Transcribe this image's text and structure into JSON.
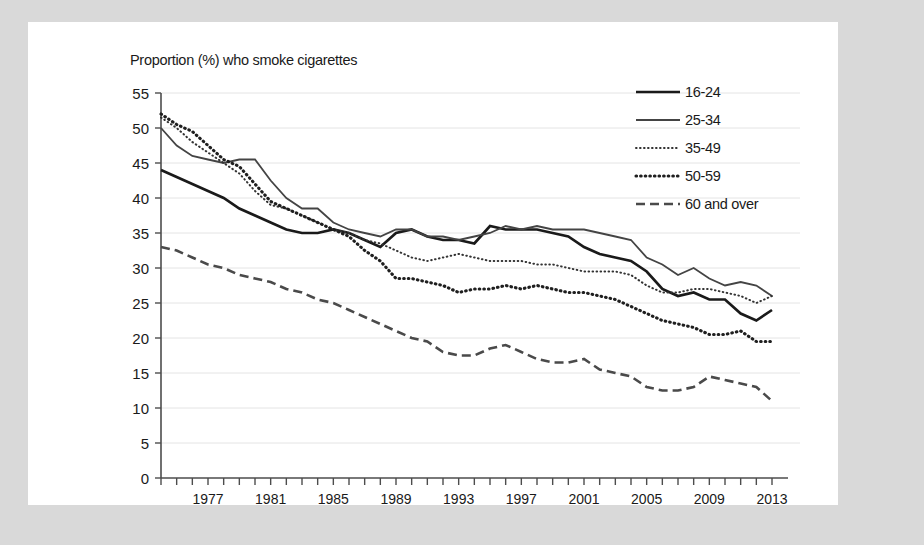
{
  "chart_data": {
    "type": "line",
    "title": "Proportion (%) who smoke cigarettes",
    "xlabel": "",
    "ylabel": "",
    "ylim": [
      0,
      55
    ],
    "xlim": [
      1974,
      2013
    ],
    "ytick_step": 5,
    "grid": true,
    "legend_position": "top-right",
    "yticks": [
      "0",
      "5",
      "10",
      "15",
      "20",
      "25",
      "30",
      "35",
      "40",
      "45",
      "50",
      "55"
    ],
    "xticks_labeled": [
      "1977",
      "1981",
      "1985",
      "1989",
      "1993",
      "1997",
      "2001",
      "2005",
      "2009",
      "2013"
    ],
    "x": [
      1974,
      1975,
      1976,
      1977,
      1978,
      1979,
      1980,
      1981,
      1982,
      1983,
      1984,
      1985,
      1986,
      1987,
      1988,
      1989,
      1990,
      1991,
      1992,
      1993,
      1994,
      1995,
      1996,
      1997,
      1998,
      1999,
      2000,
      2001,
      2002,
      2003,
      2004,
      2005,
      2006,
      2007,
      2008,
      2009,
      2010,
      2011,
      2012,
      2013
    ],
    "series": [
      {
        "name": "16-24",
        "style": "solid-thick",
        "values": [
          44,
          43,
          42,
          41,
          40,
          38.5,
          37.5,
          36.5,
          35.5,
          35,
          35,
          35.5,
          35,
          34,
          33,
          35,
          35.5,
          34.5,
          34,
          34,
          33.5,
          36,
          35.5,
          35.5,
          35.5,
          35,
          34.5,
          33,
          32,
          31.5,
          31,
          29.5,
          27,
          26,
          26.5,
          25.5,
          25.5,
          23.5,
          22.5,
          24
        ]
      },
      {
        "name": "25-34",
        "style": "solid-thin",
        "values": [
          50,
          47.5,
          46,
          45.5,
          45,
          45.5,
          45.5,
          42.5,
          40,
          38.5,
          38.5,
          36.5,
          35.5,
          35,
          34.5,
          35.5,
          35.5,
          34.5,
          34.5,
          34,
          34.5,
          35,
          36,
          35.5,
          36,
          35.5,
          35.5,
          35.5,
          35,
          34.5,
          34,
          31.5,
          30.5,
          29,
          30,
          28.5,
          27.5,
          28,
          27.5,
          26
        ]
      },
      {
        "name": "35-49",
        "style": "dotted-fine",
        "values": [
          51.5,
          50,
          48,
          46.5,
          45,
          43.5,
          41,
          39,
          38.5,
          37.5,
          36.5,
          35.5,
          35,
          34,
          33.5,
          32.5,
          31.5,
          31,
          31.5,
          32,
          31.5,
          31,
          31,
          31,
          30.5,
          30.5,
          30,
          29.5,
          29.5,
          29.5,
          29,
          27.5,
          26.5,
          26.5,
          27,
          27,
          26.5,
          26,
          25,
          26
        ]
      },
      {
        "name": "50-59",
        "style": "dotted-bold",
        "values": [
          52,
          50.5,
          49.5,
          47.5,
          45.5,
          44.5,
          42,
          39.5,
          38.5,
          37.5,
          36.5,
          35.5,
          34.5,
          32.5,
          31,
          28.5,
          28.5,
          28,
          27.5,
          26.5,
          27,
          27,
          27.5,
          27,
          27.5,
          27,
          26.5,
          26.5,
          26,
          25.5,
          24.5,
          23.5,
          22.5,
          22,
          21.5,
          20.5,
          20.5,
          21,
          19.5,
          19.5
        ]
      },
      {
        "name": "60 and over",
        "style": "dashed",
        "values": [
          33,
          32.5,
          31.5,
          30.5,
          30,
          29,
          28.5,
          28,
          27,
          26.5,
          25.5,
          25,
          24,
          23,
          22,
          21,
          20,
          19.5,
          18,
          17.5,
          17.5,
          18.5,
          19,
          18,
          17,
          16.5,
          16.5,
          17,
          15.5,
          15,
          14.5,
          13,
          12.5,
          12.5,
          13,
          14.5,
          14,
          13.5,
          13,
          11
        ]
      }
    ]
  }
}
